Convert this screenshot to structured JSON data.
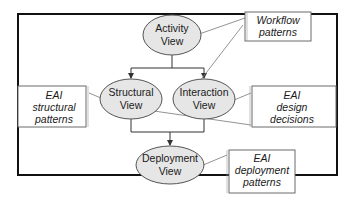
{
  "diagram": {
    "type": "architecture-views",
    "colors": {
      "frame": "#111111",
      "ellipse_fill": "#e6e6e6",
      "ellipse_stroke": "#555555",
      "note_stroke": "#6a6a6a",
      "connector": "#333333",
      "annotation_line": "#777777",
      "background": "#ffffff"
    },
    "nodes": [
      {
        "id": "activity",
        "line1": "Activity",
        "line2": "View"
      },
      {
        "id": "structural",
        "line1": "Structural",
        "line2": "View"
      },
      {
        "id": "interaction",
        "line1": "Interaction",
        "line2": "View"
      },
      {
        "id": "deployment",
        "line1": "Deployment",
        "line2": "View"
      }
    ],
    "notes": [
      {
        "id": "workflow",
        "lines": [
          "Workflow",
          "patterns"
        ],
        "attached_to": "activity, interaction"
      },
      {
        "id": "eai-structural",
        "lines": [
          "EAI",
          "structural",
          "patterns"
        ],
        "attached_to": "structural"
      },
      {
        "id": "eai-design",
        "lines": [
          "EAI",
          "design",
          "decisions"
        ],
        "attached_to": "interaction, structural"
      },
      {
        "id": "eai-deployment",
        "lines": [
          "EAI",
          "deployment",
          "patterns"
        ],
        "attached_to": "deployment"
      }
    ],
    "edges": [
      {
        "from": "activity",
        "to": "structural",
        "arrow": true
      },
      {
        "from": "activity",
        "to": "interaction",
        "arrow": true
      },
      {
        "from": "structural",
        "to": "deployment",
        "arrow": true
      },
      {
        "from": "interaction",
        "to": "deployment",
        "arrow": true
      }
    ]
  }
}
